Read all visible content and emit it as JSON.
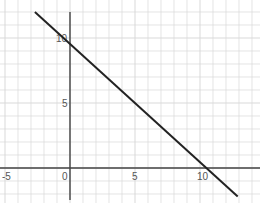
{
  "chart_data": {
    "type": "line",
    "title": "",
    "xlabel": "",
    "ylabel": "",
    "grid": true,
    "x_ticks": [
      -5,
      0,
      5,
      10
    ],
    "y_ticks": [
      5,
      10
    ],
    "x_tick_labels": [
      "-5",
      "0",
      "5",
      "10"
    ],
    "y_tick_labels": [
      "5",
      "10"
    ],
    "xlim": [
      -5.3,
      14.7
    ],
    "ylim": [
      -2.5,
      12.5
    ],
    "series": [
      {
        "name": "line",
        "color": "#222222",
        "x": [
          -2.7,
          12.9
        ],
        "y": [
          12.0,
          -2.2
        ],
        "x_intercept": 10.5,
        "y_intercept": 9.5
      }
    ]
  },
  "colors": {
    "grid": "#d9d9d9",
    "axis": "#444444",
    "line": "#222222",
    "background": "#ffffff"
  }
}
